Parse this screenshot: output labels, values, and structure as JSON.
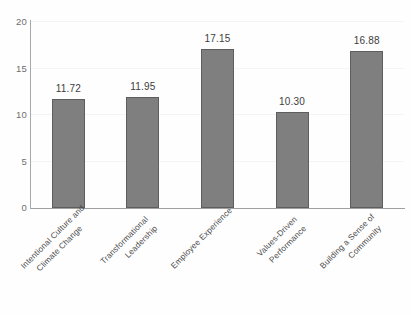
{
  "chart_data": {
    "type": "bar",
    "title": "",
    "subtitle": "",
    "xlabel": "",
    "ylabel": "",
    "ylim": [
      0,
      20
    ],
    "yticks": [
      "0",
      "5",
      "10",
      "15",
      "20"
    ],
    "ytick_values": [
      0,
      5,
      10,
      15,
      20
    ],
    "grid": true,
    "legend": false,
    "categories": [
      "Intentional Culture and\nClimate Change",
      "Transformational\nLeadership",
      "Employee Experience",
      "Values-Driven\nPerformance",
      "Building a Sense of\nCommunity"
    ],
    "values": [
      11.72,
      11.95,
      17.15,
      10.3,
      16.88
    ],
    "value_labels": [
      "11.72",
      "11.95",
      "17.15",
      "10.30",
      "16.88"
    ],
    "bar_color": "#7f7f7f",
    "bar_edge_color": "#5e5e5e",
    "axis_color": "#a0a0a0",
    "grid_color": "#f4f4f4",
    "text_color": "#4a4a4a",
    "background": "#fefefe"
  }
}
